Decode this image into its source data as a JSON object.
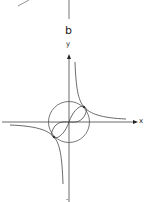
{
  "figure": {
    "panel_label": "b",
    "axes": {
      "x_label": "x",
      "y_label": "y",
      "bottom_label": "-"
    },
    "curves": [
      "x-axis",
      "y-axis",
      "circle",
      "lemniscate",
      "hyperbola-upper-right",
      "hyperbola-lower-left"
    ],
    "colors": {
      "stroke": "#444444",
      "background": "#ffffff"
    }
  }
}
